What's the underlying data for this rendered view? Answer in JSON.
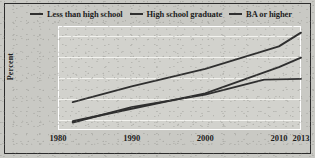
{
  "chart_data": {
    "type": "line",
    "title": "",
    "subtitle": "",
    "xlabel": "",
    "ylabel": "Percent",
    "xlim": [
      1980,
      2013
    ],
    "ylim": [
      2.5,
      27.5
    ],
    "grid": true,
    "legend_position": "top",
    "x_ticks": [
      "1980",
      "1990",
      "2000",
      "2010",
      "2013"
    ],
    "x_tick_values": [
      1980,
      1990,
      2000,
      2010,
      2013
    ],
    "y_ticks": [
      "5%",
      "10%",
      "15%",
      "20%",
      "25%"
    ],
    "y_tick_values": [
      5,
      10,
      15,
      20,
      25
    ],
    "series": [
      {
        "name": "Less than high school",
        "color": "#2f2f2f",
        "x": [
          1982,
          1990,
          2000,
          2010,
          2013
        ],
        "values": [
          9.2,
          13.0,
          17.2,
          22.6,
          25.9
        ]
      },
      {
        "name": "High school graduate",
        "color": "#2f2f2f",
        "x": [
          1982,
          1990,
          2000,
          2010,
          2013
        ],
        "values": [
          4.6,
          7.6,
          11.3,
          17.6,
          19.9
        ]
      },
      {
        "name": "BA or higher",
        "color": "#2f2f2f",
        "x": [
          1982,
          1990,
          2000,
          2008,
          2013
        ],
        "values": [
          4.3,
          8.0,
          11.0,
          14.6,
          14.8
        ]
      }
    ]
  },
  "legend": {
    "items": [
      {
        "label": "Less than high school"
      },
      {
        "label": "High school graduate"
      },
      {
        "label": "BA or higher"
      }
    ]
  },
  "colors": {
    "line": "#2f2f2f",
    "paper": "#c9c9c4",
    "plot_background": "#d2d2cd",
    "gridline": "#f2f2ee",
    "frame": "#2b2b2b",
    "text": "#1d1d1d"
  }
}
